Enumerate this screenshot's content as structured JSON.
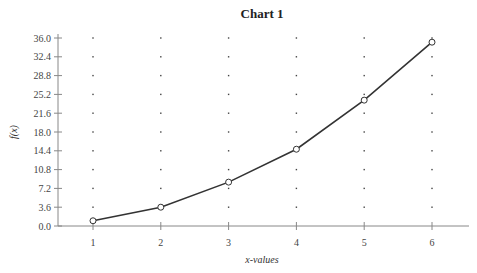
{
  "chart_data": {
    "type": "line",
    "title": "Chart 1",
    "xlabel": "x-values",
    "ylabel": "f(x)",
    "categories": [
      "1",
      "2",
      "3",
      "4",
      "5",
      "6"
    ],
    "x": [
      1,
      2,
      3,
      4,
      5,
      6
    ],
    "series": [
      {
        "name": "f(x)",
        "values": [
          1.0,
          3.6,
          8.4,
          14.7,
          24.1,
          35.2
        ]
      }
    ],
    "y_ticks": [
      "0.0",
      "3.6",
      "7.2",
      "10.8",
      "14.4",
      "18.0",
      "21.6",
      "25.2",
      "28.8",
      "32.4",
      "36.0"
    ],
    "ylim": [
      0,
      36
    ],
    "grid": "dotted",
    "legend": "none",
    "marker": "open-circle"
  },
  "colors": {
    "line": "#333333",
    "axis": "#888888",
    "grid_dot": "#444444",
    "marker_fill": "#ffffff"
  }
}
